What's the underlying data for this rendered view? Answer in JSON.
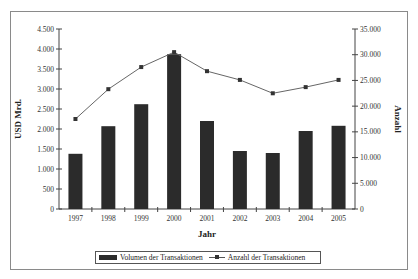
{
  "chart_data": {
    "type": "bar+line",
    "categories": [
      "1997",
      "1998",
      "1999",
      "2000",
      "2001",
      "2002",
      "2003",
      "2004",
      "2005"
    ],
    "series": [
      {
        "name": "Volumen der Transaktionen",
        "type": "bar",
        "axis": "left",
        "color": "#2b2b2b",
        "values": [
          1380,
          2070,
          2620,
          3870,
          2200,
          1450,
          1400,
          1950,
          2080
        ]
      },
      {
        "name": "Anzahl der Transaktionen",
        "type": "line",
        "axis": "right",
        "color": "#555555",
        "marker": "square",
        "values": [
          17500,
          23300,
          27600,
          30500,
          26800,
          25100,
          22500,
          23700,
          25100
        ]
      }
    ],
    "title": "",
    "xlabel": "Jahr",
    "ylabel": "USD Mrd.",
    "y2label": "Anzahl",
    "ylim": [
      0,
      4500
    ],
    "y2lim": [
      0,
      35000
    ],
    "yticks": [
      "0",
      "500",
      "1.000",
      "1.500",
      "2.000",
      "2.500",
      "3.000",
      "3.500",
      "4.000",
      "4.500"
    ],
    "y2ticks": [
      "0",
      "5.000",
      "10.000",
      "15.000",
      "20.000",
      "25.000",
      "30.000",
      "35.000"
    ],
    "grid": false,
    "legend_position": "bottom"
  },
  "legend": {
    "bar_label": "Volumen der Transaktionen",
    "line_label": "Anzahl der Transaktionen"
  },
  "axes": {
    "x_title": "Jahr",
    "y_title": "USD Mrd.",
    "y2_title": "Anzahl"
  }
}
